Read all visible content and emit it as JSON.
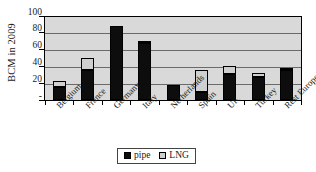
{
  "chart_data": {
    "type": "bar",
    "subtype": "stacked",
    "title": "",
    "xlabel": "",
    "ylabel": "BCM in 2009",
    "ylim": [
      0,
      100
    ],
    "yticks": [
      100,
      80,
      60,
      40,
      20,
      0
    ],
    "ytick_labels": [
      "100",
      "80",
      "60",
      "40",
      "20",
      "-"
    ],
    "grid": true,
    "legend_position": "bottom-center",
    "categories": [
      "Belgium",
      "France",
      "Germany",
      "Italy",
      "Netherlands",
      "Spain",
      "UK",
      "Turkey",
      "Rest Europe"
    ],
    "series": [
      {
        "name": "pipe",
        "color": "#0d0d0d",
        "values": [
          15,
          35,
          88,
          67,
          17,
          9,
          30,
          27,
          35
        ]
      },
      {
        "name": "LNG",
        "color": "#cfcfcf",
        "values": [
          7,
          14,
          0,
          2,
          0,
          26,
          10,
          5,
          3
        ]
      }
    ],
    "totals": [
      22,
      49,
      88,
      69,
      17,
      35,
      40,
      32,
      38
    ]
  },
  "legend": {
    "entries": [
      {
        "label": "pipe",
        "swatch": "#0d0d0d"
      },
      {
        "label": "LNG",
        "swatch": "#cfcfcf"
      }
    ]
  },
  "colors": {
    "plot_background": "#d9d9d9",
    "gridline": "#6a6a6a",
    "frame": "#000000",
    "pipe": "#0d0d0d",
    "lng": "#cfcfcf",
    "page_background": "#ffffff"
  }
}
